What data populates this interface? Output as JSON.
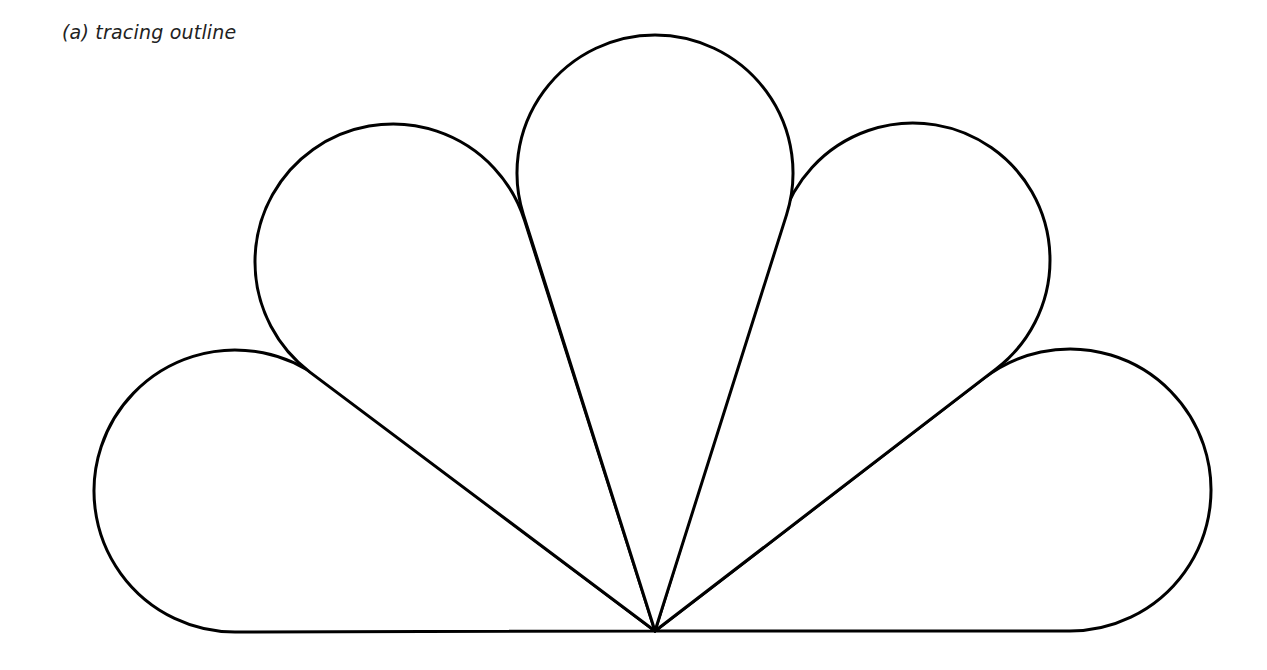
{
  "caption": "(a)  tracing outline",
  "figure": {
    "stroke_color": "#000000",
    "stroke_width": 3,
    "fill_color": "#ffffff",
    "apex": [
      655,
      631
    ],
    "baseline_y": 631,
    "petals": [
      {
        "name": "petal-left-bottom",
        "cx": 235,
        "cy": 491,
        "r": 141
      },
      {
        "name": "petal-left-top",
        "cx": 393,
        "cy": 262,
        "r": 138
      },
      {
        "name": "petal-center",
        "cx": 655,
        "cy": 173,
        "r": 138
      },
      {
        "name": "petal-right-top",
        "cx": 913,
        "cy": 260,
        "r": 137
      },
      {
        "name": "petal-right-bottom",
        "cx": 1070,
        "cy": 490,
        "r": 141
      }
    ]
  }
}
